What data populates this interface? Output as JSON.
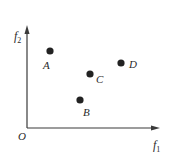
{
  "diagram": {
    "type": "objective-space-scatter",
    "axes": {
      "x_label": "f",
      "x_subscript": "1",
      "y_label": "f",
      "y_subscript": "2",
      "origin_label": "O",
      "color": "#3a3a3a"
    },
    "points": [
      {
        "label": "A",
        "cx": 50,
        "cy": 51,
        "lx": 47,
        "ly": 69
      },
      {
        "label": "B",
        "cx": 80,
        "cy": 100,
        "lx": 88,
        "ly": 116
      },
      {
        "label": "C",
        "cx": 90,
        "cy": 74,
        "lx": 101,
        "ly": 83
      },
      {
        "label": "D",
        "cx": 121,
        "cy": 63,
        "lx": 134,
        "ly": 68
      }
    ],
    "point_color": "#222222"
  }
}
